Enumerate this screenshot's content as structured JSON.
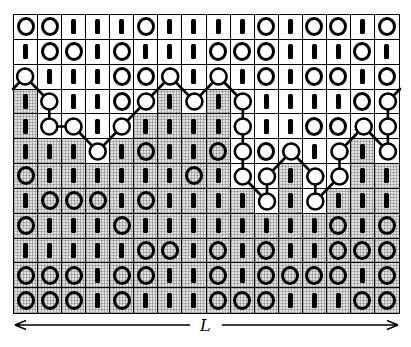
{
  "figure": {
    "length_label": "L",
    "grid": {
      "cols": 16,
      "rows": 12,
      "symbols": [
        "OOIIIOIIIIOIOOIO",
        "IOOIOIIIOOOIIIOI",
        "WIIIOOWIWIOIOOIO",
        "IWIIOWIWIWIIIIOW",
        "IWWIWIIIIWIIOOWW",
        "IIIWIOIIOWOWIWIW",
        "OIIIIIIOIWWIWWII",
        "IOOOIOIIIIWIWIII",
        "OIIIOIIIIIIIIOIO",
        "IIIIIOOIOIOIIOOO",
        "OOOIOOIIOIOOOOIO",
        "OOOIOIIIOOOIIIOO"
      ],
      "shaded": [
        "0000000000000000",
        "0000000000000000",
        "0000000000000000",
        "1000001010000000",
        "1000011110000000",
        "1110111110000010",
        "1111111110010011",
        "1111111111010111",
        "1111111111111111",
        "1111111111111111",
        "1111111111111111",
        "1111111111111111"
      ],
      "wall_nodes": [
        [
          1,
          3
        ],
        [
          2,
          4
        ],
        [
          2,
          5
        ],
        [
          3,
          5
        ],
        [
          4,
          6
        ],
        [
          5,
          5
        ],
        [
          6,
          4
        ],
        [
          7,
          3
        ],
        [
          8,
          4
        ],
        [
          9,
          3
        ],
        [
          10,
          4
        ],
        [
          10,
          5
        ],
        [
          10,
          6
        ],
        [
          10,
          7
        ],
        [
          11,
          8
        ],
        [
          11,
          7
        ],
        [
          12,
          6
        ],
        [
          13,
          7
        ],
        [
          13,
          8
        ],
        [
          14,
          7
        ],
        [
          14,
          6
        ],
        [
          15,
          5
        ],
        [
          16,
          6
        ],
        [
          16,
          5
        ],
        [
          16,
          4
        ]
      ],
      "wall_entry_edge": "left",
      "wall_exit_edge": "right"
    }
  }
}
